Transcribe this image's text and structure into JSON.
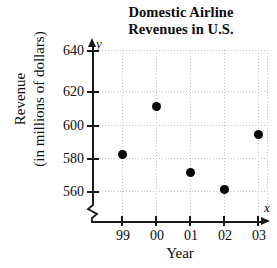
{
  "chart_data": {
    "type": "scatter",
    "title": "Domestic Airline Revenues in U.S.",
    "title_lines": [
      "Domestic Airline",
      "Revenues in U.S."
    ],
    "xlabel": "Year",
    "ylabel": "Revenue (in millions of dollars)",
    "ylabel_lines": [
      "Revenue",
      "(in millions of dollars)"
    ],
    "x_axis_letter": "x",
    "y_axis_letter": "y",
    "categories": [
      "99",
      "00",
      "01",
      "02",
      "03"
    ],
    "values": [
      582,
      611,
      571,
      561,
      594
    ],
    "points": [
      {
        "x": "99",
        "y": 582
      },
      {
        "x": "00",
        "y": 611
      },
      {
        "x": "01",
        "y": 571
      },
      {
        "x": "02",
        "y": 561
      },
      {
        "x": "03",
        "y": 594
      }
    ],
    "yticks": [
      560,
      580,
      600,
      620,
      640
    ],
    "ytick_labels": [
      "560",
      "580",
      "600",
      "620",
      "640"
    ],
    "xtick_labels": [
      "99",
      "00",
      "01",
      "02",
      "03"
    ],
    "ylim": [
      548,
      648
    ],
    "grid": true,
    "axis_break": true,
    "legend": null,
    "marker_color": "#050505",
    "axis_color": "#1a1a1a",
    "grid_color": "#c3c3c3"
  }
}
